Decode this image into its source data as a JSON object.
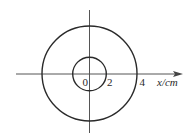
{
  "diagram": {
    "type": "concentric-circles-on-axis",
    "axis": {
      "label": "x/cm",
      "ticks": [
        {
          "value": "0",
          "label": "0"
        },
        {
          "value": "2",
          "label": "2"
        },
        {
          "value": "4",
          "label": "4"
        }
      ]
    },
    "circles": [
      {
        "name": "inner-circle",
        "radius_cm": 2
      },
      {
        "name": "outer-circle",
        "radius_cm": 4
      }
    ],
    "colors": {
      "stroke": "#2a2a2a",
      "axis": "#555555",
      "background": "#ffffff"
    }
  }
}
